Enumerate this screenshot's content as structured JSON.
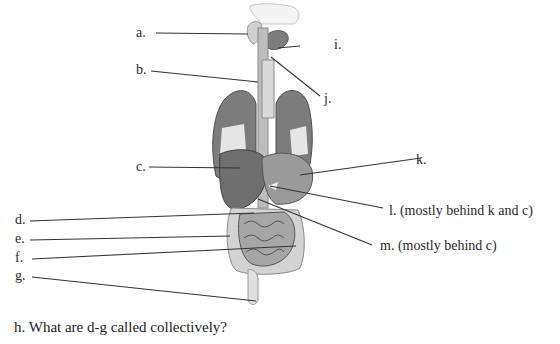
{
  "diagram": {
    "labels": [
      {
        "id": "a",
        "text": "a."
      },
      {
        "id": "b",
        "text": "b."
      },
      {
        "id": "c",
        "text": "c."
      },
      {
        "id": "d",
        "text": "d."
      },
      {
        "id": "e",
        "text": "e."
      },
      {
        "id": "f",
        "text": "f."
      },
      {
        "id": "g",
        "text": "g."
      },
      {
        "id": "i",
        "text": "i."
      },
      {
        "id": "j",
        "text": "j."
      },
      {
        "id": "k",
        "text": "k."
      },
      {
        "id": "l",
        "text": "l. (mostly behind k and c)"
      },
      {
        "id": "m",
        "text": "m. (mostly behind c)"
      }
    ],
    "question": "h.  What are d-g called collectively?"
  },
  "colors": {
    "organ_dark": "#6e6e6e",
    "organ_mid": "#9a9a9a",
    "organ_light": "#c8c8c8",
    "organ_pale": "#e2e2e2",
    "line": "#333333"
  }
}
